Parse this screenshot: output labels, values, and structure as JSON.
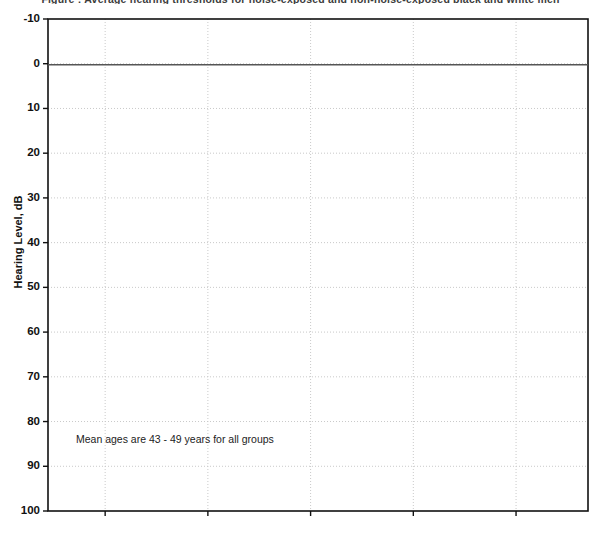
{
  "title": "Figure : Average hearing thresholds for noise-exposed and non-noise-exposed black and white men",
  "annotation": "Mean ages are 43 - 49 years for all groups",
  "axes": {
    "y_title": "Hearing Level, dB",
    "y_ticks": [
      "-10",
      "0",
      "10",
      "20",
      "30",
      "40",
      "50",
      "60",
      "70",
      "80",
      "90",
      "100"
    ],
    "x_ticks": [
      "0.5",
      "1",
      "2",
      "4",
      "8"
    ]
  },
  "legend": {
    "items": [
      {
        "label": "Black non-noise",
        "marker": "filled-diamond",
        "color": "#000000"
      },
      {
        "label": "Black exposed",
        "marker": "filled-square",
        "color": "#000000"
      },
      {
        "label": "White non-noise",
        "marker": "open-circle",
        "color": "#000000"
      },
      {
        "label": "White exposed",
        "marker": "open-square",
        "color": "#000000"
      }
    ]
  },
  "chart_data": {
    "type": "line",
    "title": "Figure : Average hearing thresholds for noise-exposed and non-noise-exposed black and white men",
    "xlabel": "",
    "ylabel": "Hearing Level, dB",
    "x_scale": "log2",
    "x_tick_values": [
      0.5,
      1,
      2,
      4,
      8
    ],
    "x_tick_labels": [
      "0.5",
      "1",
      "2",
      "4",
      "8"
    ],
    "xlim": [
      0.34,
      13.0
    ],
    "ylim": [
      -10,
      100
    ],
    "y_inverted": true,
    "y_tick_values": [
      -10,
      0,
      10,
      20,
      30,
      40,
      50,
      60,
      70,
      80,
      90,
      100
    ],
    "grid": true,
    "legend_position": "lower right",
    "annotations": [
      {
        "text": "Mean ages are 43 - 49 years for all groups",
        "x": 0.62,
        "y": 86
      }
    ],
    "series": [
      {
        "name": "Black non-noise",
        "marker": "filled-diamond",
        "color": "#000000",
        "x": [
          0.5,
          1,
          2,
          3,
          4,
          6,
          8
        ],
        "values": [
          6.0,
          5.5,
          4.5,
          11.5,
          16.3,
          14.5,
          17.5
        ]
      },
      {
        "name": "Black exposed",
        "marker": "filled-square",
        "color": "#000000",
        "x": [
          0.5,
          1,
          2,
          3,
          4,
          6,
          8
        ],
        "values": [
          8.7,
          9.0,
          11.0,
          12.0,
          16.5,
          16.5,
          23.5
        ]
      },
      {
        "name": "White non-noise",
        "marker": "open-circle",
        "color": "#000000",
        "x": [
          0.5,
          1,
          2,
          3,
          4,
          6,
          8,
          10
        ],
        "values": [
          6.5,
          7.0,
          11.0,
          14.5,
          22.0,
          27.0,
          28.8,
          29.0
        ]
      },
      {
        "name": "White exposed",
        "marker": "open-square",
        "color": "#000000",
        "x": [
          0.5,
          1,
          2,
          3,
          4,
          6,
          10
        ],
        "values": [
          16.0,
          13.0,
          11.0,
          21.5,
          28.5,
          29.5,
          29.0
        ]
      }
    ]
  }
}
